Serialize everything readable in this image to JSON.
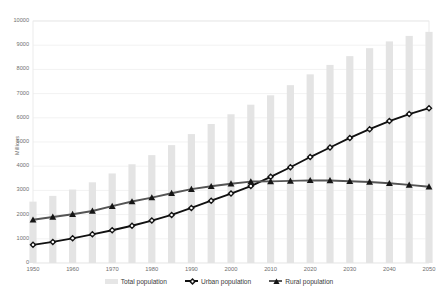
{
  "chart_data": {
    "type": "bar",
    "title": "",
    "subtitle": "",
    "xlabel": "",
    "ylabel": "Millions",
    "ylim": [
      0,
      10000
    ],
    "ytick_step": 1000,
    "yticks": [
      "0",
      "1000",
      "2000",
      "3000",
      "4000",
      "5000",
      "6000",
      "7000",
      "8000",
      "9000",
      "10000"
    ],
    "xlim": [
      1950,
      2050
    ],
    "xticks": [
      "1950",
      "1960",
      "1970",
      "1980",
      "1990",
      "2000",
      "2010",
      "2020",
      "2030",
      "2040",
      "2050"
    ],
    "grid": true,
    "legend_position": "bottom",
    "x": [
      1950,
      1955,
      1960,
      1965,
      1970,
      1975,
      1980,
      1985,
      1990,
      1995,
      2000,
      2005,
      2010,
      2015,
      2020,
      2025,
      2030,
      2035,
      2040,
      2045,
      2050
    ],
    "series": [
      {
        "name": "Total population",
        "kind": "bar",
        "color": "#e4e4e4",
        "values": [
          2536,
          2773,
          3035,
          3335,
          3700,
          4079,
          4458,
          4871,
          5327,
          5744,
          6145,
          6542,
          6930,
          7349,
          7795,
          8185,
          8548,
          8877,
          9157,
          9384,
          9551
        ]
      },
      {
        "name": "Urban population",
        "kind": "line",
        "color": "#111111",
        "marker": "circle",
        "values": [
          751,
          872,
          1020,
          1185,
          1352,
          1539,
          1754,
          1988,
          2275,
          2574,
          2868,
          3177,
          3559,
          3957,
          4379,
          4773,
          5167,
          5530,
          5863,
          6155,
          6398
        ]
      },
      {
        "name": "Rural population",
        "kind": "line",
        "color": "#555555",
        "marker": "triangle",
        "values": [
          1785,
          1901,
          2015,
          2150,
          2348,
          2540,
          2704,
          2883,
          3052,
          3170,
          3277,
          3365,
          3371,
          3392,
          3416,
          3412,
          3381,
          3347,
          3294,
          3229,
          3153
        ]
      }
    ],
    "annotations": [
      {
        "text": "Urban population overtakes rural population",
        "x": 2007
      }
    ]
  },
  "legend": {
    "items": [
      {
        "label": "Total population",
        "swatch": "bar-swatch"
      },
      {
        "label": "Urban population",
        "swatch": "line-circle-swatch"
      },
      {
        "label": "Rural population",
        "swatch": "line-triangle-swatch"
      }
    ]
  },
  "colors": {
    "bar": "#e4e4e4",
    "urban_line": "#111111",
    "rural_line": "#555555",
    "grid": "#ececec",
    "plot_border": "#e3e3e3",
    "tick_text": "#6f6f6f",
    "background": "#ffffff"
  }
}
